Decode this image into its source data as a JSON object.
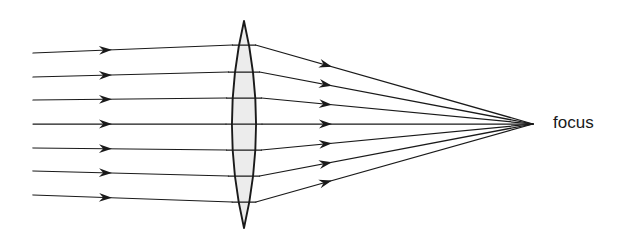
{
  "diagram": {
    "background_color": "#ffffff",
    "ink_color": "#1a1a1a",
    "lens_fill_color": "#ececec",
    "width": 642,
    "height": 251,
    "focus_label": "focus",
    "label_position": {
      "x": 553,
      "y": 124
    }
  },
  "lens": {
    "name": "biconvex-converging-lens",
    "center_x": 244,
    "top_apex_y": 21,
    "bottom_apex_y": 228,
    "half_width": 18,
    "plane_x": 244
  },
  "chart_data": {
    "type": "diagram",
    "focal_point": {
      "x": 533,
      "y": 124
    },
    "ray_start_x": 33,
    "ray_entry_x": 244,
    "incoming_arrow_x": 112,
    "outgoing_arrow_x": 332,
    "rays": [
      {
        "id": 1,
        "start_y": 53,
        "lens_y": 45,
        "label": "ray-1"
      },
      {
        "id": 2,
        "start_y": 77,
        "lens_y": 72,
        "label": "ray-2"
      },
      {
        "id": 3,
        "start_y": 100,
        "lens_y": 98,
        "label": "ray-3"
      },
      {
        "id": 4,
        "start_y": 124,
        "lens_y": 124,
        "label": "ray-4"
      },
      {
        "id": 5,
        "start_y": 148,
        "lens_y": 150,
        "label": "ray-5"
      },
      {
        "id": 6,
        "start_y": 171,
        "lens_y": 176,
        "label": "ray-6"
      },
      {
        "id": 7,
        "start_y": 195,
        "lens_y": 202,
        "label": "ray-7"
      }
    ]
  }
}
